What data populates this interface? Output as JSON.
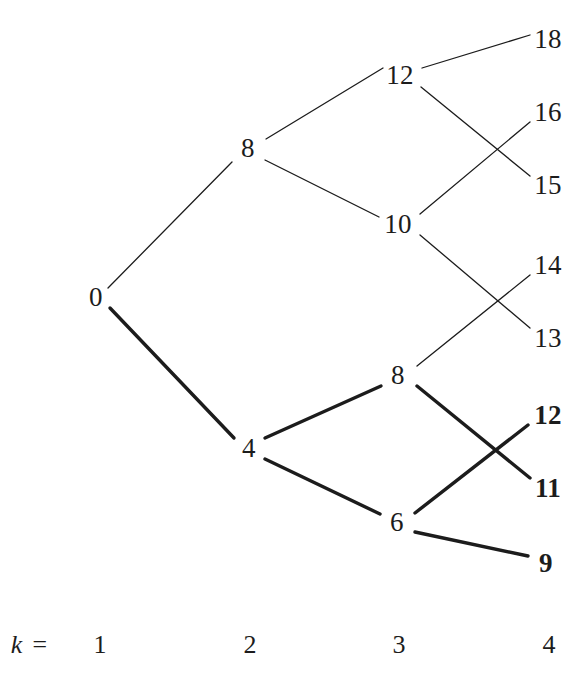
{
  "figure": {
    "type": "lattice-tree-diagram",
    "background_color": "#ffffff",
    "ink_color": "#1c1c1c",
    "width": 587,
    "height": 687
  },
  "axis": {
    "key_label": "k =",
    "key_x": 30,
    "key_y": 645,
    "ticks": [
      {
        "label": "1",
        "x": 100,
        "y": 645
      },
      {
        "label": "2",
        "x": 250,
        "y": 645
      },
      {
        "label": "3",
        "x": 399,
        "y": 645
      },
      {
        "label": "4",
        "x": 549,
        "y": 645
      }
    ]
  },
  "nodes": [
    {
      "id": "n0",
      "label": "0",
      "k": 1,
      "x": 96,
      "y": 297,
      "bold": false
    },
    {
      "id": "k2_8",
      "label": "8",
      "k": 2,
      "x": 248,
      "y": 148,
      "bold": false
    },
    {
      "id": "k2_4",
      "label": "4",
      "k": 2,
      "x": 249,
      "y": 448,
      "bold": false
    },
    {
      "id": "k3_12",
      "label": "12",
      "k": 3,
      "x": 400,
      "y": 75,
      "bold": false
    },
    {
      "id": "k3_10",
      "label": "10",
      "k": 3,
      "x": 398,
      "y": 224,
      "bold": false
    },
    {
      "id": "k3_8",
      "label": "8",
      "k": 3,
      "x": 398,
      "y": 375,
      "bold": false
    },
    {
      "id": "k3_6",
      "label": "6",
      "k": 3,
      "x": 397,
      "y": 522,
      "bold": false
    },
    {
      "id": "k4_18",
      "label": "18",
      "k": 4,
      "x": 548,
      "y": 39,
      "bold": false
    },
    {
      "id": "k4_16",
      "label": "16",
      "k": 4,
      "x": 548,
      "y": 112,
      "bold": false
    },
    {
      "id": "k4_15",
      "label": "15",
      "k": 4,
      "x": 548,
      "y": 185,
      "bold": false
    },
    {
      "id": "k4_14",
      "label": "14",
      "k": 4,
      "x": 548,
      "y": 265,
      "bold": false
    },
    {
      "id": "k4_13",
      "label": "13",
      "k": 4,
      "x": 548,
      "y": 338,
      "bold": false
    },
    {
      "id": "k4_12",
      "label": "12",
      "k": 4,
      "x": 548,
      "y": 415,
      "bold": true
    },
    {
      "id": "k4_11",
      "label": "11",
      "k": 4,
      "x": 548,
      "y": 488,
      "bold": true
    },
    {
      "id": "k4_9",
      "label": "9",
      "k": 4,
      "x": 546,
      "y": 563,
      "bold": true
    }
  ],
  "edges": [
    {
      "from": "n0",
      "to": "k2_8",
      "x1": 108,
      "y1": 288,
      "x2": 232,
      "y2": 162,
      "weight": "thin",
      "width": 1.3
    },
    {
      "from": "n0",
      "to": "k2_4",
      "x1": 110,
      "y1": 308,
      "x2": 234,
      "y2": 438,
      "weight": "thick",
      "width": 3.4
    },
    {
      "from": "k2_8",
      "to": "k3_12",
      "x1": 266,
      "y1": 139,
      "x2": 383,
      "y2": 68,
      "weight": "thin",
      "width": 1.3
    },
    {
      "from": "k2_8",
      "to": "k3_10",
      "x1": 265,
      "y1": 160,
      "x2": 379,
      "y2": 217,
      "weight": "thin",
      "width": 1.3
    },
    {
      "from": "k2_4",
      "to": "k3_8",
      "x1": 265,
      "y1": 438,
      "x2": 381,
      "y2": 386,
      "weight": "thick",
      "width": 3.4
    },
    {
      "from": "k2_4",
      "to": "k3_6",
      "x1": 265,
      "y1": 459,
      "x2": 380,
      "y2": 514,
      "weight": "thick",
      "width": 3.4
    },
    {
      "from": "k3_12",
      "to": "k4_18",
      "x1": 422,
      "y1": 68,
      "x2": 530,
      "y2": 35,
      "weight": "thin",
      "width": 1.3
    },
    {
      "from": "k3_12",
      "to": "k4_15",
      "x1": 421,
      "y1": 87,
      "x2": 530,
      "y2": 176,
      "weight": "thin",
      "width": 1.3
    },
    {
      "from": "k3_10",
      "to": "k4_16",
      "x1": 420,
      "y1": 214,
      "x2": 530,
      "y2": 122,
      "weight": "thin",
      "width": 1.3
    },
    {
      "from": "k3_10",
      "to": "k4_13",
      "x1": 420,
      "y1": 235,
      "x2": 530,
      "y2": 328,
      "weight": "thin",
      "width": 1.3
    },
    {
      "from": "k3_8",
      "to": "k4_14",
      "x1": 417,
      "y1": 366,
      "x2": 530,
      "y2": 275,
      "weight": "thin",
      "width": 1.3
    },
    {
      "from": "k3_8",
      "to": "k4_11",
      "x1": 417,
      "y1": 386,
      "x2": 530,
      "y2": 478,
      "weight": "thick",
      "width": 3.4
    },
    {
      "from": "k3_6",
      "to": "k4_12",
      "x1": 415,
      "y1": 513,
      "x2": 528,
      "y2": 425,
      "weight": "thick",
      "width": 3.4
    },
    {
      "from": "k3_6",
      "to": "k4_9",
      "x1": 415,
      "y1": 532,
      "x2": 528,
      "y2": 556,
      "weight": "thick",
      "width": 3.4
    }
  ],
  "chart_data": {
    "type": "tree",
    "title": "",
    "xlabel": "k",
    "levels": [
      {
        "k": 1,
        "values": [
          0
        ]
      },
      {
        "k": 2,
        "values": [
          8,
          4
        ]
      },
      {
        "k": 3,
        "values": [
          12,
          10,
          8,
          6
        ]
      },
      {
        "k": 4,
        "values": [
          18,
          16,
          15,
          14,
          13,
          12,
          11,
          9
        ]
      }
    ],
    "branches": [
      {
        "parent": 0,
        "k": 1,
        "children": [
          8,
          4
        ]
      },
      {
        "parent": 8,
        "k": 2,
        "children": [
          12,
          10
        ]
      },
      {
        "parent": 4,
        "k": 2,
        "children": [
          8,
          6
        ]
      },
      {
        "parent": 12,
        "k": 3,
        "children": [
          18,
          15
        ]
      },
      {
        "parent": 10,
        "k": 3,
        "children": [
          16,
          13
        ]
      },
      {
        "parent": 8,
        "k": 3,
        "children": [
          14,
          11
        ]
      },
      {
        "parent": 6,
        "k": 3,
        "children": [
          12,
          9
        ]
      }
    ],
    "emphasized_path_nodes": [
      0,
      4,
      8,
      6,
      12,
      11,
      9
    ],
    "bold_leaf_values": [
      12,
      11,
      9
    ],
    "plain_leaf_values": [
      18,
      16,
      15,
      14,
      13
    ],
    "xtick_labels": [
      "1",
      "2",
      "3",
      "4"
    ],
    "legend": [],
    "grid": false
  }
}
